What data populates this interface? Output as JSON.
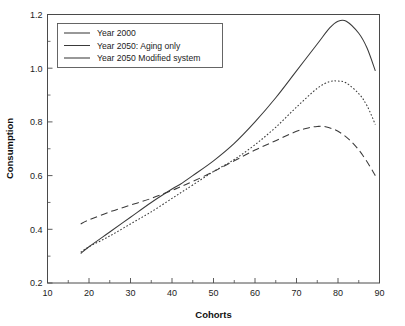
{
  "chart_data": {
    "type": "line",
    "title": "",
    "xlabel": "Cohorts",
    "ylabel": "Consumption",
    "xlim": [
      10,
      90
    ],
    "ylim": [
      0.2,
      1.2
    ],
    "xticks": [
      10,
      20,
      30,
      40,
      50,
      60,
      70,
      80,
      90
    ],
    "xtick_labels": [
      "10",
      "20",
      "30",
      "40",
      "50",
      "60",
      "70",
      "80",
      "90"
    ],
    "yticks": [
      0.2,
      0.4,
      0.6,
      0.8,
      1.0,
      1.2
    ],
    "ytick_labels": [
      "0.2",
      "0.4",
      "0.6",
      "0.8",
      "1.0",
      "1.2"
    ],
    "x_minor_step": 5,
    "y_minor_step": 0.1,
    "grid": false,
    "legend_position": "upper-left",
    "series": [
      {
        "name": "Year 2000",
        "style": "solid",
        "color": "#3a3a3a",
        "x": [
          18,
          20,
          25,
          30,
          35,
          40,
          42,
          45,
          50,
          55,
          60,
          65,
          70,
          75,
          78,
          80,
          82,
          85,
          87,
          89
        ],
        "values": [
          0.31,
          0.335,
          0.39,
          0.445,
          0.5,
          0.55,
          0.568,
          0.6,
          0.655,
          0.72,
          0.8,
          0.89,
          0.99,
          1.09,
          1.15,
          1.175,
          1.175,
          1.13,
          1.075,
          0.99
        ]
      },
      {
        "name": "Year 2050: Aging only",
        "style": "dashed",
        "color": "#3a3a3a",
        "x": [
          18,
          20,
          25,
          30,
          35,
          40,
          42,
          45,
          50,
          55,
          60,
          65,
          70,
          73,
          75,
          77,
          80,
          83,
          86,
          89
        ],
        "values": [
          0.42,
          0.435,
          0.465,
          0.49,
          0.515,
          0.545,
          0.558,
          0.578,
          0.615,
          0.655,
          0.695,
          0.73,
          0.765,
          0.778,
          0.783,
          0.782,
          0.765,
          0.73,
          0.675,
          0.6
        ]
      },
      {
        "name": "Year 2050 Modified system",
        "style": "dotted",
        "color": "#3a3a3a",
        "x": [
          18,
          20,
          25,
          30,
          35,
          40,
          42,
          45,
          50,
          55,
          60,
          65,
          70,
          75,
          78,
          80,
          82,
          85,
          87,
          89
        ],
        "values": [
          0.315,
          0.335,
          0.375,
          0.42,
          0.465,
          0.515,
          0.535,
          0.565,
          0.615,
          0.66,
          0.715,
          0.78,
          0.855,
          0.925,
          0.95,
          0.952,
          0.945,
          0.905,
          0.86,
          0.79
        ]
      }
    ],
    "annotations": {
      "crossing_solid_dashed": {
        "x": 42.5,
        "y": 0.565
      },
      "crossing_dotted_dashed": {
        "x": 55.5,
        "y": 0.657
      }
    }
  },
  "legend": {
    "entries": [
      {
        "label": "Year 2000"
      },
      {
        "label": "Year 2050: Aging only"
      },
      {
        "label": "Year 2050 Modified system"
      }
    ]
  }
}
